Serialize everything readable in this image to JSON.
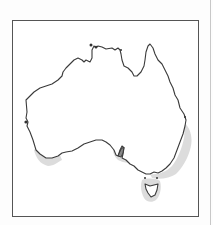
{
  "map": {
    "subject": "Australia outline map",
    "caption": "Map of Australia with shaded southern coastal regions",
    "colors": {
      "outline": "#3a3a3a",
      "shading": "#d6d6d6",
      "frame": "#555555",
      "background": "#ffffff"
    },
    "regions": [
      {
        "name": "mainland",
        "shaded": false
      },
      {
        "name": "south-west-coast",
        "shaded": true
      },
      {
        "name": "spencer-gulf-region",
        "shaded": true
      },
      {
        "name": "south-east-coast",
        "shaded": true
      },
      {
        "name": "tasmania",
        "shaded": true
      }
    ]
  }
}
